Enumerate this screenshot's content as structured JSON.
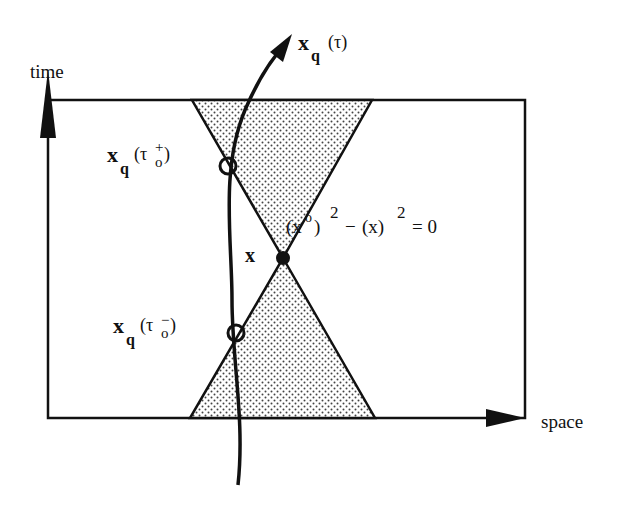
{
  "diagram": {
    "type": "spacetime light-cone diagram",
    "axes": {
      "time_label": "time",
      "space_label": "space"
    },
    "worldline": {
      "label_main": "x",
      "label_sub": "q",
      "label_arg": "(τ)"
    },
    "future_intersection": {
      "label_main": "x",
      "label_sub": "q",
      "label_arg_open": "(τ",
      "label_arg_sub": "o",
      "label_arg_sup": "+",
      "label_arg_close": ")"
    },
    "past_intersection": {
      "label_main": "x",
      "label_sub": "q",
      "label_arg_open": "(τ",
      "label_arg_sub": "o",
      "label_arg_sup": "−",
      "label_arg_close": ")"
    },
    "event_point": {
      "label": "x"
    },
    "cone_equation": {
      "part1_open": "(x",
      "part1_sup": "o",
      "part1_close": ")",
      "part1_exp": "2",
      "minus": "−",
      "part2": "(x)",
      "part2_exp": "2",
      "equals": "= 0"
    },
    "colors": {
      "ink": "#111111",
      "cone_fill": "#d9d9d9",
      "dot": "#333333",
      "background": "#ffffff"
    }
  }
}
